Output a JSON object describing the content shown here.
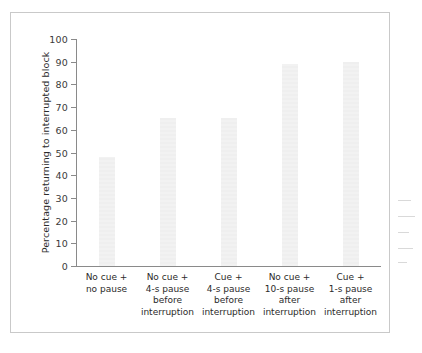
{
  "chart_data": {
    "type": "bar",
    "title": "",
    "xlabel": "",
    "ylabel": "Percentage returning to interrupted block",
    "ylim": [
      0,
      100
    ],
    "yticks": [
      0,
      10,
      20,
      30,
      40,
      50,
      60,
      70,
      80,
      90,
      100
    ],
    "grid": false,
    "legend": "none",
    "categories": [
      "No cue + no pause",
      "No cue + 4-s pause before interruption",
      "Cue + 4-s pause before interruption",
      "No cue + 10-s pause after interruption",
      "Cue + 1-s pause after interruption"
    ],
    "category_lines": [
      [
        "No cue +",
        "no pause"
      ],
      [
        "No cue +",
        "4-s pause",
        "before",
        "interruption"
      ],
      [
        "Cue +",
        "4-s pause",
        "before",
        "interruption"
      ],
      [
        "No cue +",
        "10-s pause",
        "after",
        "interruption"
      ],
      [
        "Cue +",
        "1-s pause",
        "after",
        "interruption"
      ]
    ],
    "values": [
      48,
      65,
      65,
      89,
      90
    ],
    "bar_color": "#f1f1f1",
    "axis_color": "#8a8a8a",
    "text_color": "#2b2b2b"
  },
  "axis": {
    "tick_labels": [
      "100",
      "90",
      "80",
      "70",
      "60",
      "50",
      "40",
      "30",
      "20",
      "10",
      "0"
    ],
    "y_title": "Percentage returning to interrupted block"
  }
}
